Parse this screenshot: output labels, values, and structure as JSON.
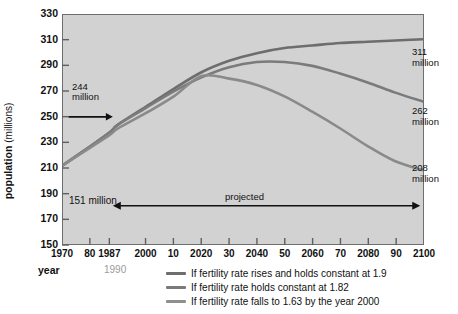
{
  "chart_data": {
    "type": "line",
    "title": "",
    "xlabel": "year",
    "ylabel_bold": "population",
    "ylabel_unit": "(millions)",
    "xlim": [
      1970,
      2100
    ],
    "ylim": [
      150,
      330
    ],
    "ytick_step": 20,
    "grid": false,
    "legend_position": "bottom",
    "yticks": [
      330,
      310,
      290,
      270,
      250,
      230,
      210,
      190,
      170,
      150
    ],
    "xticks": [
      {
        "value": 1970,
        "label": "1970"
      },
      {
        "value": 1980,
        "label": "80"
      },
      {
        "value": 1987,
        "label": "1987"
      },
      {
        "value": 2000,
        "label": "2000"
      },
      {
        "value": 2010,
        "label": "10"
      },
      {
        "value": 2020,
        "label": "2020"
      },
      {
        "value": 2030,
        "label": "30"
      },
      {
        "value": 2040,
        "label": "2040"
      },
      {
        "value": 2050,
        "label": "50"
      },
      {
        "value": 2060,
        "label": "2060"
      },
      {
        "value": 2070,
        "label": "70"
      },
      {
        "value": 2080,
        "label": "2080"
      },
      {
        "value": 2090,
        "label": "90"
      },
      {
        "value": 2100,
        "label": "2100"
      }
    ],
    "alt_year_label": "1990",
    "series": [
      {
        "name": "If fertility rate rises and holds constant at 1.9",
        "color": "#6d6d6d",
        "end_label": "311\nmillion",
        "x": [
          1970,
          1980,
          1987,
          1990,
          2000,
          2010,
          2020,
          2030,
          2040,
          2050,
          2060,
          2070,
          2080,
          2090,
          2100
        ],
        "y": [
          212,
          227,
          238,
          244,
          258,
          272,
          285,
          294,
          300,
          304,
          306,
          308,
          309,
          310,
          311
        ]
      },
      {
        "name": "If fertility rate holds constant at 1.82",
        "color": "#7b7b7b",
        "end_label": "262\nmillion",
        "x": [
          1970,
          1980,
          1987,
          1990,
          2000,
          2010,
          2020,
          2030,
          2040,
          2050,
          2060,
          2070,
          2080,
          2090,
          2100
        ],
        "y": [
          212,
          227,
          238,
          244,
          257,
          270,
          281,
          289,
          293,
          293,
          290,
          284,
          277,
          269,
          262
        ]
      },
      {
        "name": "If fertility rate falls to 1.63 by the year 2000",
        "color": "#8a8a8a",
        "end_label": "208\nmillion",
        "x": [
          1970,
          1980,
          1987,
          1990,
          2000,
          2010,
          2020,
          2030,
          2040,
          2050,
          2060,
          2070,
          2080,
          2090,
          2100
        ],
        "y": [
          212,
          226,
          236,
          241,
          253,
          266,
          282,
          280,
          275,
          266,
          254,
          241,
          227,
          215,
          208
        ]
      }
    ],
    "annotations": [
      {
        "id": "anno-244",
        "text": "244\nmillion",
        "note": "arrow pointing right to curves at 1990"
      },
      {
        "id": "anno-151",
        "text": "151 million",
        "note": "value at 1970 baseline area"
      },
      {
        "id": "anno-projected",
        "text": "projected",
        "note": "double-headed arrow from ~1990 to 2100"
      }
    ]
  },
  "labels": {
    "y_axis_bold": "population",
    "y_axis_unit": "(millions)",
    "x_axis": "year",
    "alt_year": "1990",
    "anno_244": "244",
    "anno_244_unit": "million",
    "anno_151": "151 million",
    "anno_projected": "projected",
    "end_311": "311",
    "end_311_unit": "million",
    "end_262": "262",
    "end_262_unit": "million",
    "end_208": "208",
    "end_208_unit": "million"
  },
  "legend": {
    "items": [
      {
        "label": "If fertility rate rises and holds constant at 1.9",
        "color": "#6d6d6d"
      },
      {
        "label": "If fertility rate holds constant at 1.82",
        "color": "#7b7b7b"
      },
      {
        "label": "If fertility rate falls to 1.63 by the year 2000",
        "color": "#8f8f8f"
      }
    ]
  },
  "colors": {
    "plot_background": "#d2d2d2",
    "frame": "#6f6f6f",
    "text": "#111111",
    "alt_year_text": "#9a9a9a",
    "page_background": "#ffffff"
  }
}
